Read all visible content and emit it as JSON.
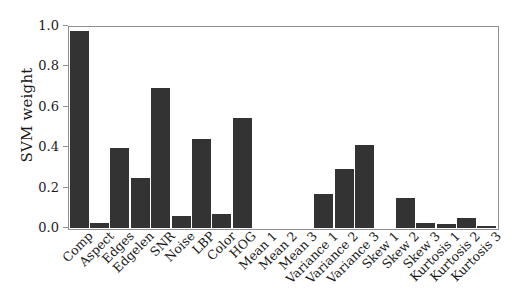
{
  "chart_data": {
    "type": "bar",
    "title": "",
    "xlabel": "",
    "ylabel": "SVM weight",
    "ylim": [
      0.0,
      1.0
    ],
    "yticks": [
      "0.0",
      "0.2",
      "0.4",
      "0.6",
      "0.8",
      "1.0"
    ],
    "ytick_values": [
      0.0,
      0.2,
      0.4,
      0.6,
      0.8,
      1.0
    ],
    "grid": false,
    "legend": "none",
    "bar_color": "#333333",
    "axis_color": "#8f8f8f",
    "categories": [
      "Comp",
      "Aspect",
      "Edges",
      "Edgelen",
      "SNR",
      "Noise",
      "LBP",
      "Color",
      "HOG",
      "Mean 1",
      "Mean 2",
      "Mean 3",
      "Variance 1",
      "Variance 2",
      "Variance 3",
      "Skew 1",
      "Skew 2",
      "Skew 3",
      "Kurtosis 1",
      "Kurtosis 2",
      "Kurtosis 3"
    ],
    "values": [
      0.98,
      0.025,
      0.4,
      0.25,
      0.695,
      0.06,
      0.445,
      0.07,
      0.545,
      0.0,
      0.0,
      0.0,
      0.17,
      0.295,
      0.415,
      0.0,
      0.148,
      0.025,
      0.022,
      0.05,
      0.008
    ]
  }
}
